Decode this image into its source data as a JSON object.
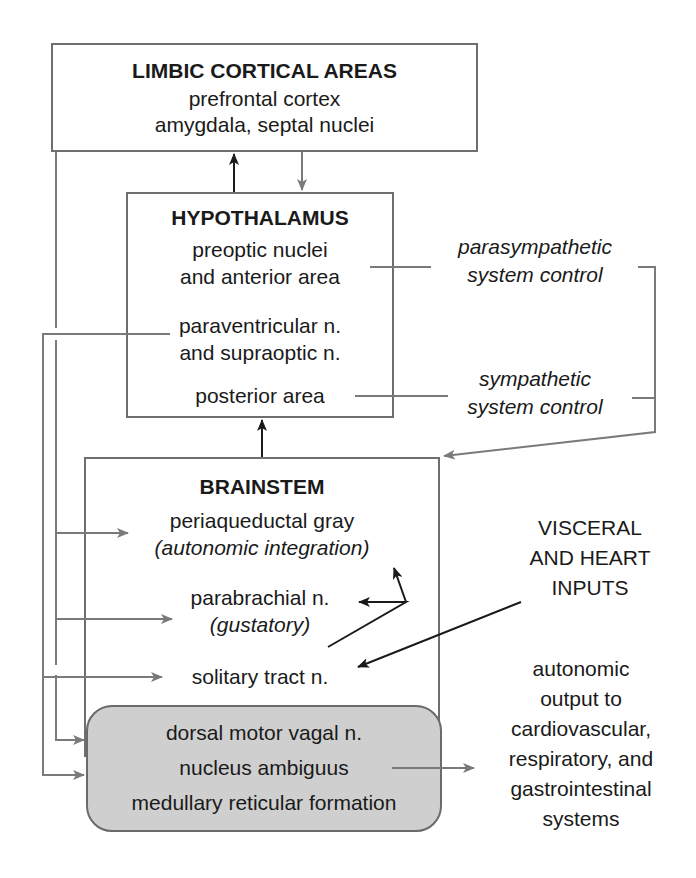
{
  "limbic": {
    "title": "LIMBIC CORTICAL AREAS",
    "line1": "prefrontal cortex",
    "line2": "amygdala, septal nuclei"
  },
  "hypothalamus": {
    "title": "HYPOTHALAMUS",
    "preoptic1": "preoptic nuclei",
    "preoptic2": "and anterior area",
    "paraventricular1": "paraventricular n.",
    "paraventricular2": "and supraoptic n.",
    "posterior": "posterior area"
  },
  "control": {
    "parasympathetic1": "parasympathetic",
    "parasympathetic2": "system control",
    "sympathetic1": "sympathetic",
    "sympathetic2": "system control"
  },
  "brainstem": {
    "title": "BRAINSTEM",
    "pag1": "periaqueductal gray",
    "pag2": "(autonomic integration)",
    "parabrachial1": "parabrachial n.",
    "parabrachial2": "(gustatory)",
    "solitary": "solitary tract n."
  },
  "visceral": {
    "line1": "VISCERAL",
    "line2": "AND HEART",
    "line3": "INPUTS"
  },
  "motor": {
    "line1": "dorsal motor vagal n.",
    "line2": "nucleus ambiguus",
    "line3": "medullary reticular formation"
  },
  "output": {
    "line1": "autonomic",
    "line2": "output to",
    "line3": "cardiovascular,",
    "line4": "respiratory, and",
    "line5": "gastrointestinal",
    "line6": "systems"
  },
  "colors": {
    "gray_line": "#7a7a7a",
    "black_line": "#1a1a1a",
    "motor_fill": "#cfcfcf"
  }
}
